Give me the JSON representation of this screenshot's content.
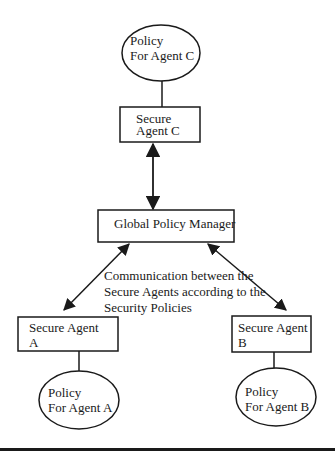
{
  "nodes": {
    "policy_c": {
      "line1": "Policy",
      "line2": "For Agent C"
    },
    "agent_c": {
      "line1": "Secure",
      "line2": "Agent C"
    },
    "global_manager": {
      "label": "Global Policy Manager"
    },
    "agent_a": {
      "line1": "Secure Agent",
      "line2": "A"
    },
    "agent_b": {
      "line1": "Secure Agent",
      "line2": "B"
    },
    "policy_a": {
      "line1": "Policy",
      "line2": "For Agent A"
    },
    "policy_b": {
      "line1": "Policy",
      "line2": "For Agent B"
    }
  },
  "annotation": {
    "line1": "Communication between the",
    "line2": "Secure Agents according to the",
    "line3": "Security Policies"
  },
  "colors": {
    "stroke": "#1a1a1a",
    "background": "#ffffff"
  }
}
